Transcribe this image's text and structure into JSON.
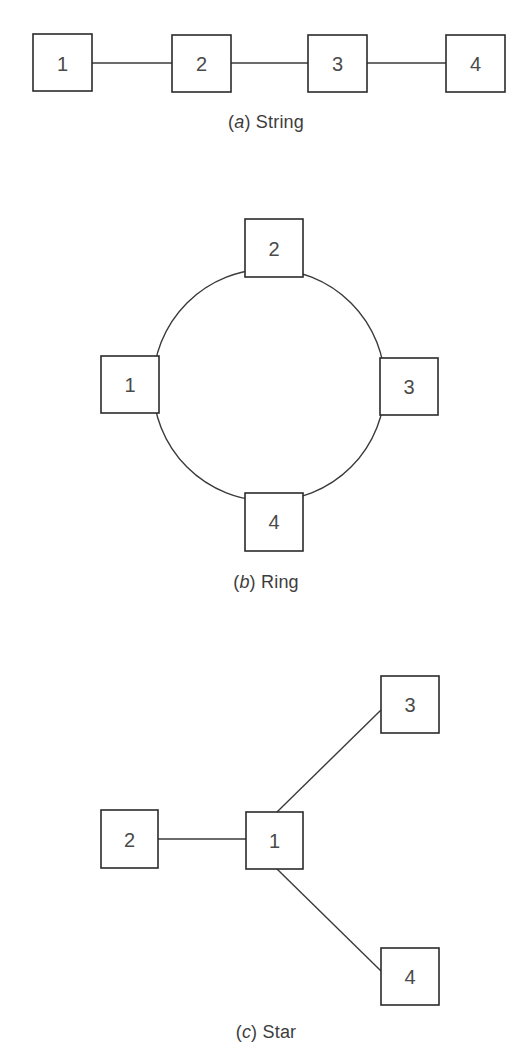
{
  "page": {
    "background": "#ffffff",
    "line_color": "#3a3a3a",
    "box_stroke": "#2b2b2b",
    "label_color": "#4a4a4a"
  },
  "figures": [
    {
      "id": "string",
      "caption_paren_open": "(",
      "caption_letter": "a",
      "caption_paren_close": ")",
      "caption_title": "String",
      "caption_full": "(a) String",
      "topology": "string",
      "nodes": [
        {
          "label": "1",
          "x": 33,
          "y": 34,
          "w": 59,
          "h": 57
        },
        {
          "label": "2",
          "x": 172,
          "y": 35,
          "w": 59,
          "h": 57
        },
        {
          "label": "3",
          "x": 308,
          "y": 35,
          "w": 59,
          "h": 57
        },
        {
          "label": "4",
          "x": 446,
          "y": 35,
          "w": 59,
          "h": 57
        }
      ],
      "edges": [
        {
          "from": "1",
          "to": "2"
        },
        {
          "from": "2",
          "to": "3"
        },
        {
          "from": "3",
          "to": "4"
        }
      ]
    },
    {
      "id": "ring",
      "caption_paren_open": "(",
      "caption_letter": "b",
      "caption_paren_close": ")",
      "caption_title": "Ring",
      "caption_full": "(b) Ring",
      "topology": "ring",
      "circle": {
        "cx": 269,
        "cy": 195,
        "r": 116
      },
      "nodes": [
        {
          "label": "1",
          "x": 101,
          "y": 166,
          "w": 58,
          "h": 57
        },
        {
          "label": "2",
          "x": 245,
          "y": 29,
          "w": 58,
          "h": 58
        },
        {
          "label": "3",
          "x": 380,
          "y": 168,
          "w": 58,
          "h": 57
        },
        {
          "label": "4",
          "x": 245,
          "y": 303,
          "w": 58,
          "h": 58
        }
      ],
      "edges": [
        {
          "from": "1",
          "to": "2"
        },
        {
          "from": "2",
          "to": "3"
        },
        {
          "from": "3",
          "to": "4"
        },
        {
          "from": "4",
          "to": "1"
        }
      ]
    },
    {
      "id": "star",
      "caption_paren_open": "(",
      "caption_letter": "c",
      "caption_paren_close": ")",
      "caption_title": "Star",
      "caption_full": "(c) Star",
      "topology": "star",
      "hub": "1",
      "nodes": [
        {
          "label": "1",
          "x": 246,
          "y": 172,
          "w": 57,
          "h": 57
        },
        {
          "label": "2",
          "x": 101,
          "y": 170,
          "w": 57,
          "h": 58
        },
        {
          "label": "3",
          "x": 381,
          "y": 36,
          "w": 58,
          "h": 57
        },
        {
          "label": "4",
          "x": 381,
          "y": 308,
          "w": 58,
          "h": 57
        }
      ],
      "edges": [
        {
          "from": "1",
          "to": "2"
        },
        {
          "from": "1",
          "to": "3"
        },
        {
          "from": "1",
          "to": "4"
        }
      ]
    }
  ]
}
